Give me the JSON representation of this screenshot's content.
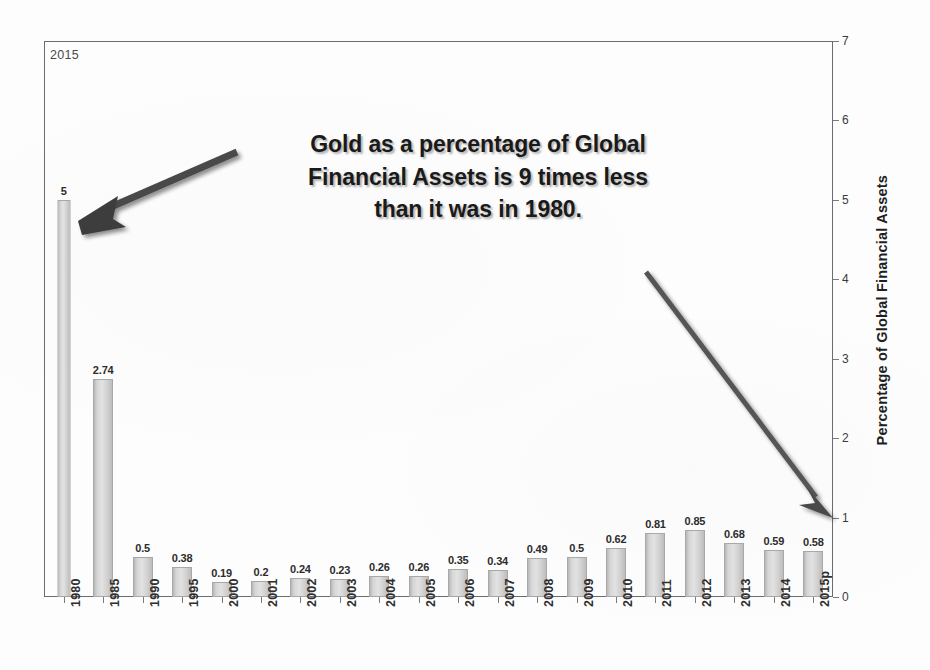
{
  "corner_label": "2015",
  "annotation": {
    "line1": "Gold as a percentage of Global",
    "line2": "Financial Assets is 9 times less",
    "line3": "than it was in 1980."
  },
  "axis": {
    "y_title": "Percentage of Global Financial Assets",
    "y_ticks": [
      "0",
      "1",
      "2",
      "3",
      "4",
      "5",
      "6",
      "7"
    ]
  },
  "colors": {
    "bar_fill": "#d6d6d6",
    "bar_edge": "#a8a8a8",
    "frame": "#6c6c6c",
    "arrow": "#4a4a4a",
    "text": "#1a1a1a"
  },
  "chart_data": {
    "type": "bar",
    "title": "Gold as a percentage of Global Financial Assets",
    "xlabel": "",
    "ylabel": "Percentage of Global Financial Assets",
    "ylim": [
      0,
      7
    ],
    "ytick_values": [
      0,
      1,
      2,
      3,
      4,
      5,
      6,
      7
    ],
    "grid": false,
    "legend": "none",
    "categories": [
      "1980",
      "1985",
      "1990",
      "1995",
      "2000",
      "2001",
      "2002",
      "2003",
      "2004",
      "2005",
      "2006",
      "2007",
      "2008",
      "2009",
      "2010",
      "2011",
      "2012",
      "2013",
      "2014",
      "2015p"
    ],
    "values": [
      5,
      2.74,
      0.5,
      0.38,
      0.19,
      0.2,
      0.24,
      0.23,
      0.26,
      0.26,
      0.35,
      0.34,
      0.49,
      0.5,
      0.62,
      0.81,
      0.85,
      0.68,
      0.59,
      0.58
    ],
    "value_labels": [
      "5",
      "2.74",
      "0.5",
      "0.38",
      "0.19",
      "0.2",
      "0.24",
      "0.23",
      "0.26",
      "0.26",
      "0.35",
      "0.34",
      "0.49",
      "0.5",
      "0.62",
      "0.81",
      "0.85",
      "0.68",
      "0.59",
      "0.58"
    ],
    "annotations": [
      {
        "text": "Gold as a percentage of Global Financial Assets is 9 times less than it was in 1980.",
        "arrow_1_from": [
          237,
          152
        ],
        "arrow_1_to": [
          84,
          219
        ],
        "arrow_2_from": [
          646,
          272
        ],
        "arrow_2_to": [
          831,
          516
        ]
      }
    ]
  }
}
